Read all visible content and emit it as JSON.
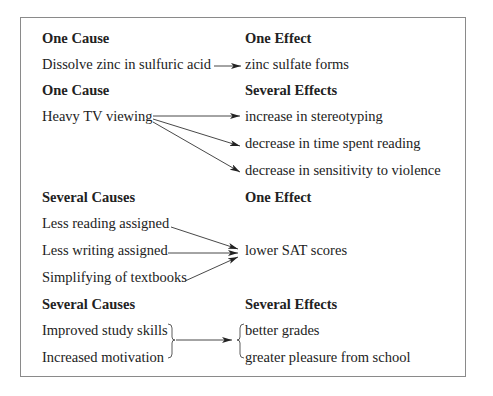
{
  "sections": [
    {
      "cause_heading": "One Cause",
      "effect_heading": "One Effect",
      "causes": [
        "Dissolve zinc in sulfuric acid"
      ],
      "effects": [
        "zinc sulfate forms"
      ]
    },
    {
      "cause_heading": "One Cause",
      "effect_heading": "Several Effects",
      "causes": [
        "Heavy TV viewing"
      ],
      "effects": [
        "increase in stereotyping",
        "decrease in time spent reading",
        "decrease in sensitivity to violence"
      ]
    },
    {
      "cause_heading": "Several Causes",
      "effect_heading": "One Effect",
      "causes": [
        "Less reading assigned",
        "Less writing assigned",
        "Simplifying of textbooks"
      ],
      "effects": [
        "lower SAT scores"
      ]
    },
    {
      "cause_heading": "Several Causes",
      "effect_heading": "Several Effects",
      "causes": [
        "Improved study skills",
        "Increased motivation"
      ],
      "effects": [
        "better grades",
        "greater pleasure from school"
      ]
    }
  ],
  "colors": {
    "border": "#8a8a8a",
    "text": "#222222",
    "arrow": "#333333"
  }
}
